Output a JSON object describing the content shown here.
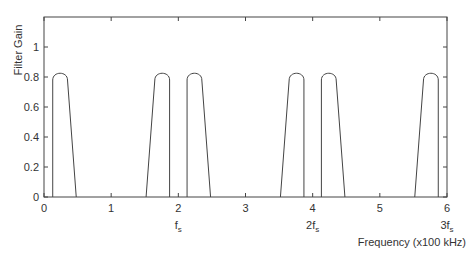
{
  "chart_data": {
    "type": "line",
    "title": "",
    "xlabel": "Frequency (x100 kHz)",
    "ylabel": "Filter Gain",
    "xlim": [
      0,
      6
    ],
    "ylim": [
      0,
      1.2
    ],
    "xticks": [
      0,
      1,
      2,
      3,
      4,
      5,
      6
    ],
    "xtick_labels": [
      "0",
      "1",
      "2",
      "3",
      "4",
      "5",
      "6"
    ],
    "yticks": [
      0,
      0.2,
      0.4,
      0.6,
      0.8,
      1
    ],
    "ytick_labels": [
      "0",
      "0.2",
      "0.4",
      "0.6",
      "0.8",
      "1"
    ],
    "grid": false,
    "legend": null,
    "annotations": [
      {
        "x": 2,
        "text": "f",
        "sub": "s"
      },
      {
        "x": 4,
        "text": "2f",
        "sub": "s"
      },
      {
        "x": 6,
        "text": "3f",
        "sub": "s"
      }
    ],
    "series": [
      {
        "name": "filter-gain",
        "description": "Six passband lobes (peak gain ~0.82) mirrored around multiples of fs",
        "lobes": [
          {
            "start": 0.13,
            "flat_start": 0.15,
            "peak": 0.25,
            "flat_end": 0.35,
            "end": 0.48,
            "steep_side": "left",
            "peak_gain": 0.82
          },
          {
            "start": 1.52,
            "flat_start": 1.65,
            "peak": 1.75,
            "flat_end": 1.85,
            "end": 1.87,
            "steep_side": "right",
            "peak_gain": 0.82
          },
          {
            "start": 2.13,
            "flat_start": 2.15,
            "peak": 2.25,
            "flat_end": 2.35,
            "end": 2.48,
            "steep_side": "left",
            "peak_gain": 0.82
          },
          {
            "start": 3.52,
            "flat_start": 3.65,
            "peak": 3.75,
            "flat_end": 3.85,
            "end": 3.87,
            "steep_side": "right",
            "peak_gain": 0.82
          },
          {
            "start": 4.13,
            "flat_start": 4.15,
            "peak": 4.25,
            "flat_end": 4.35,
            "end": 4.48,
            "steep_side": "left",
            "peak_gain": 0.82
          },
          {
            "start": 5.52,
            "flat_start": 5.65,
            "peak": 5.75,
            "flat_end": 5.85,
            "end": 5.87,
            "steep_side": "right",
            "peak_gain": 0.82
          }
        ]
      }
    ]
  },
  "colors": {
    "line": "#444444",
    "axis": "#444444",
    "text": "#333333",
    "background": "#ffffff"
  }
}
